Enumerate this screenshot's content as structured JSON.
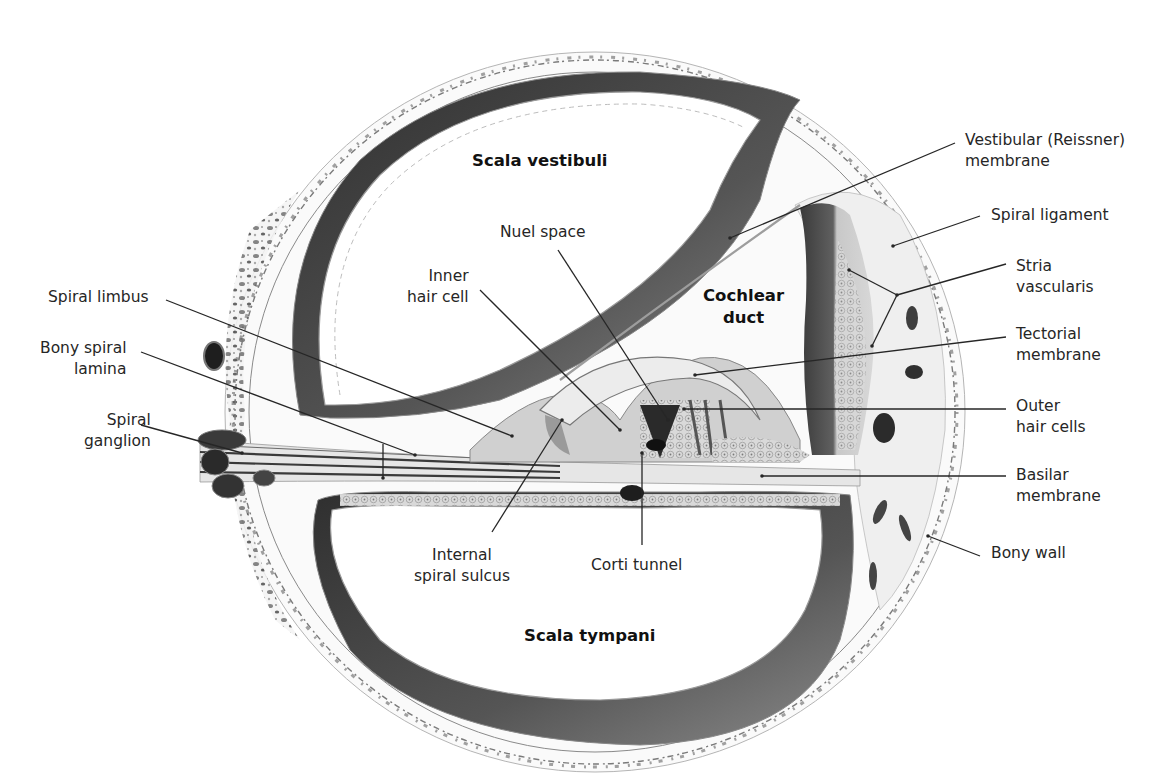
{
  "figure": {
    "colors": {
      "ink": "#262626",
      "bone": "#cfcfcf",
      "dark_tissue": "#3c3c3c",
      "stria": "#5a5a5a",
      "background": "#ffffff"
    }
  },
  "regions": [
    {
      "id": "scala-vestibuli",
      "text": "Scala vestibuli",
      "x": 472,
      "y": 150
    },
    {
      "id": "cochlear-duct",
      "text": "Cochlear\nduct",
      "x": 703,
      "y": 285
    },
    {
      "id": "scala-tympani",
      "text": "Scala tympani",
      "x": 524,
      "y": 625
    }
  ],
  "labels": [
    {
      "id": "vestibular-membrane",
      "text": "Vestibular (Reissner)\nmembrane",
      "x": 965,
      "y": 130,
      "align": "left",
      "line": [
        [
          955,
          143
        ],
        [
          730,
          238
        ]
      ]
    },
    {
      "id": "spiral-ligament",
      "text": "Spiral ligament",
      "x": 991,
      "y": 205,
      "align": "left",
      "line": [
        [
          980,
          216
        ],
        [
          893,
          246
        ]
      ]
    },
    {
      "id": "stria-vascularis",
      "text": "Stria\nvascularis",
      "x": 1016,
      "y": 256,
      "align": "left",
      "line": [
        [
          1006,
          264
        ],
        [
          897,
          295
        ]
      ],
      "branches": [
        [
          [
            897,
            295
          ],
          [
            849,
            270
          ]
        ],
        [
          [
            897,
            295
          ],
          [
            872,
            346
          ]
        ]
      ]
    },
    {
      "id": "tectorial-membrane",
      "text": "Tectorial\nmembrane",
      "x": 1016,
      "y": 324,
      "align": "left",
      "line": [
        [
          1006,
          337
        ],
        [
          695,
          375
        ]
      ]
    },
    {
      "id": "outer-hair-cells",
      "text": "Outer\nhair cells",
      "x": 1016,
      "y": 396,
      "align": "left",
      "line": [
        [
          1006,
          409
        ],
        [
          684,
          409
        ]
      ]
    },
    {
      "id": "basilar-membrane",
      "text": "Basilar\nmembrane",
      "x": 1016,
      "y": 465,
      "align": "left",
      "line": [
        [
          1006,
          476
        ],
        [
          762,
          476
        ]
      ]
    },
    {
      "id": "bony-wall",
      "text": "Bony wall",
      "x": 991,
      "y": 543,
      "align": "left",
      "line": [
        [
          980,
          556
        ],
        [
          928,
          536
        ]
      ]
    },
    {
      "id": "nuel-space",
      "text": "Nuel space",
      "x": 500,
      "y": 222,
      "align": "left",
      "line": [
        [
          558,
          250
        ],
        [
          668,
          420
        ]
      ]
    },
    {
      "id": "inner-hair-cell",
      "text": "Inner\nhair cell",
      "x": 407,
      "y": 266,
      "align": "right",
      "line": [
        [
          480,
          290
        ],
        [
          620,
          430
        ]
      ]
    },
    {
      "id": "spiral-limbus",
      "text": "Spiral limbus",
      "x": 48,
      "y": 287,
      "align": "right",
      "line": [
        [
          166,
          300
        ],
        [
          512,
          436
        ]
      ]
    },
    {
      "id": "bony-spiral-lamina",
      "text": "Bony spiral\nlamina",
      "x": 40,
      "y": 338,
      "align": "right",
      "line": [
        [
          141,
          352
        ],
        [
          415,
          455
        ]
      ],
      "branches": [
        [
          [
            383,
            444
          ],
          [
            383,
            478
          ]
        ]
      ]
    },
    {
      "id": "spiral-ganglion",
      "text": "Spiral\nganglion",
      "x": 84,
      "y": 410,
      "align": "right",
      "line": [
        [
          141,
          425
        ],
        [
          242,
          453
        ]
      ]
    },
    {
      "id": "internal-spiral-sulcus",
      "text": "Internal\nspiral sulcus",
      "x": 414,
      "y": 545,
      "align": "center",
      "line": [
        [
          492,
          532
        ],
        [
          562,
          420
        ]
      ]
    },
    {
      "id": "corti-tunnel",
      "text": "Corti tunnel",
      "x": 591,
      "y": 555,
      "align": "left",
      "line": [
        [
          642,
          545
        ],
        [
          642,
          453
        ]
      ]
    }
  ]
}
